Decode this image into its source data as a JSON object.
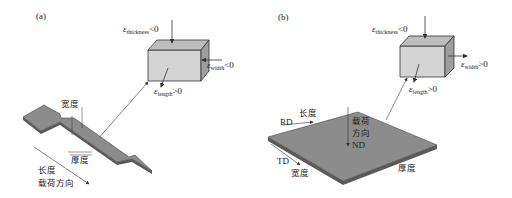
{
  "panel_a": {
    "label": "(a)",
    "cube": {
      "thickness": {
        "sym": "ε",
        "sub": "thickness",
        "rel": "<0"
      },
      "width": {
        "sym": "ε",
        "sub": "width",
        "rel": "<0"
      },
      "length": {
        "sym": "ε",
        "sub": "length",
        "rel": ">0"
      }
    },
    "specimen": {
      "width_label": "宽度",
      "thickness_label": "厚度",
      "length_label": "长度",
      "load_label": "载荷方向"
    }
  },
  "panel_b": {
    "label": "(b)",
    "cube": {
      "thickness": {
        "sym": "ε",
        "sub": "thickness",
        "rel": "<0"
      },
      "width": {
        "sym": "ε",
        "sub": "width",
        "rel": ">0"
      },
      "length": {
        "sym": "ε",
        "sub": "length",
        "rel": ">0"
      }
    },
    "sheet": {
      "rd_label": "RD",
      "length_label": "长度",
      "load_line1": "载荷",
      "load_line2": "方向",
      "nd_label": "ND",
      "td_label": "TD",
      "width_label": "宽度",
      "thickness_label": "厚度"
    }
  },
  "colors": {
    "cube_face": "#d4d4d4",
    "cube_top": "#bdbdbd",
    "cube_side": "#9e9e9e",
    "specimen_fill": "#8c8c8c",
    "specimen_edge": "#5a5a5a",
    "line": "#333333"
  }
}
